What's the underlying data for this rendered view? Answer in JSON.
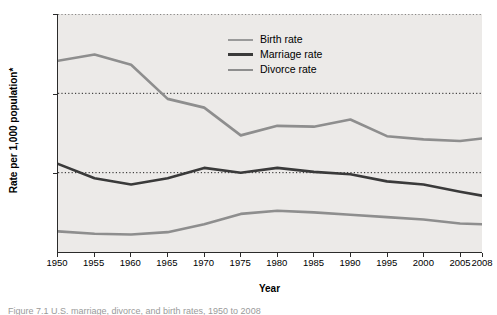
{
  "chart_data": {
    "type": "line",
    "title": "",
    "xlabel": "Year",
    "ylabel": "Rate per 1,000 population*",
    "xlim": [
      1950,
      2008
    ],
    "ylim": [
      0,
      30
    ],
    "yticks": [
      0,
      10,
      20,
      30
    ],
    "xticks": [
      1950,
      1955,
      1960,
      1965,
      1970,
      1975,
      1980,
      1985,
      1990,
      1995,
      2000,
      2005,
      2008
    ],
    "grid": "horizontal-dotted",
    "legend_position": "inside-top-center",
    "x": [
      1950,
      1955,
      1960,
      1965,
      1970,
      1975,
      1980,
      1985,
      1990,
      1995,
      2000,
      2005,
      2008
    ],
    "series": [
      {
        "name": "Birth rate",
        "color": "#8e8e8e",
        "values": [
          24.1,
          24.9,
          23.6,
          19.3,
          18.2,
          14.7,
          15.9,
          15.8,
          16.7,
          14.6,
          14.2,
          14.0,
          14.3
        ]
      },
      {
        "name": "Marriage rate",
        "color": "#3a3a3a",
        "values": [
          11.1,
          9.3,
          8.5,
          9.3,
          10.6,
          10.0,
          10.6,
          10.1,
          9.8,
          8.9,
          8.5,
          7.6,
          7.1
        ]
      },
      {
        "name": "Divorce rate",
        "color": "#8e8e8e",
        "values": [
          2.6,
          2.3,
          2.2,
          2.5,
          3.5,
          4.8,
          5.2,
          5.0,
          4.7,
          4.4,
          4.1,
          3.6,
          3.5
        ]
      }
    ]
  },
  "legend": {
    "items": [
      {
        "label": "Birth rate",
        "color": "#9a9a9a"
      },
      {
        "label": "Marriage rate",
        "color": "#3a3a3a"
      },
      {
        "label": "Divorce rate",
        "color": "#8e8e8e"
      }
    ]
  },
  "caption": {
    "text": "Figure 7.1  U.S. marriage, divorce, and birth rates, 1950 to 2008"
  }
}
